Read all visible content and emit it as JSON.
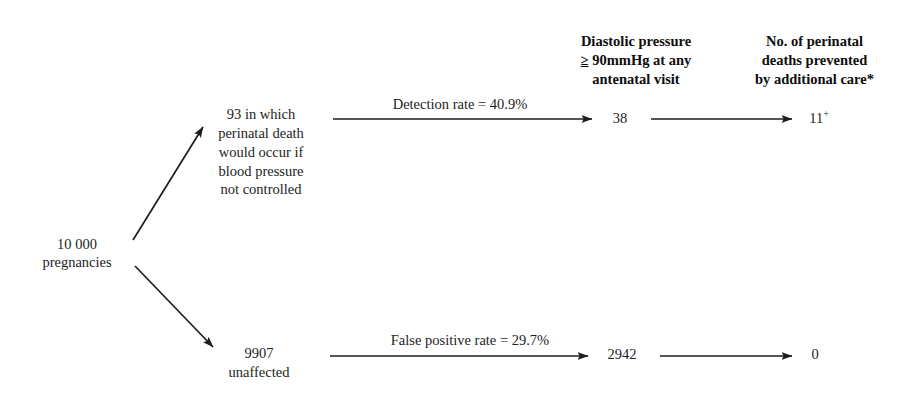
{
  "diagram": {
    "type": "flowchart",
    "nodes": {
      "root": "10 000\npregnancies",
      "affected": "93 in which\nperinatal death\nwould occur if\nblood pressure\nnot controlled",
      "unaffected": "9907\nunaffected",
      "detected": "38",
      "false_positives": "2942",
      "deaths_prevented_value": "11",
      "deaths_prevented_superscript": "+",
      "zero": "0"
    },
    "column_headers": {
      "screen_positive": {
        "line1": "Diastolic pressure",
        "ge_symbol": "≥",
        "line2_rest": " 90mmHg at any",
        "line3": "antenatal visit"
      },
      "benefit": {
        "line1": "No. of perinatal",
        "line2": "deaths prevented",
        "line3": "by additional care*"
      }
    },
    "edge_labels": {
      "detection_rate": "Detection rate = 40.9%",
      "false_positive_rate": "False positive rate = 29.7%"
    },
    "colors": {
      "background": "#ffffff",
      "ink": "#1d1d1d",
      "heading_ink": "#0d0d0d"
    }
  }
}
